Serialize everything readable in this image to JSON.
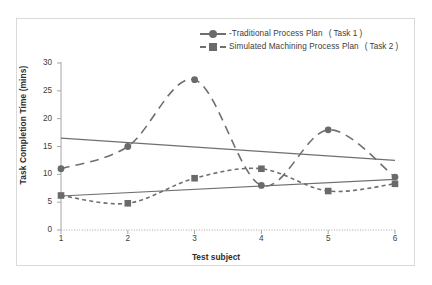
{
  "chart_data": {
    "type": "line",
    "title": "",
    "xlabel": "Test subject",
    "ylabel": "Task Completion Time (mins)",
    "x": [
      1,
      2,
      3,
      4,
      5,
      6
    ],
    "xtick_labels": [
      "1",
      "2",
      "3",
      "4",
      "5",
      "6"
    ],
    "ytick_labels": [
      "0",
      "5",
      "10",
      "15",
      "20",
      "25",
      "30"
    ],
    "yticks": [
      0,
      5,
      10,
      15,
      20,
      25,
      30
    ],
    "xlim": [
      1,
      6
    ],
    "ylim": [
      0,
      30
    ],
    "grid": false,
    "legend_position": "top-right",
    "series": [
      {
        "name": "Traditional Process Plan",
        "task": "( Task 1 )",
        "legend_label": "Traditional Process Plan",
        "legend_marker": "circle",
        "legend_dash": "solid-long-dash",
        "values": [
          11,
          15,
          27,
          8,
          18,
          9.5
        ],
        "color": "#6f6f6f"
      },
      {
        "name": "Simulated Machining Process Plan",
        "task": "( Task 2 )",
        "legend_label": "Simulated Machining Process Plan",
        "legend_marker": "square",
        "legend_dash": "dashed",
        "values": [
          6.2,
          4.8,
          9.3,
          11,
          7,
          8.3
        ],
        "color": "#6f6f6f"
      }
    ],
    "trendlines": [
      {
        "name": "Traditional Process Plan trendline",
        "for_series": "Traditional Process Plan",
        "start": [
          1,
          16.5
        ],
        "end": [
          6,
          12.5
        ],
        "style": "solid",
        "color": "#6f6f6f"
      },
      {
        "name": "Simulated Machining Process Plan trendline",
        "for_series": "Simulated Machining Process Plan",
        "start": [
          1,
          6.1
        ],
        "end": [
          6,
          9.1
        ],
        "style": "solid",
        "color": "#6f6f6f"
      }
    ],
    "legend": [
      {
        "label": "Traditional Process Plan",
        "task": "( Task 1 )",
        "marker": "circle",
        "line": "solid"
      },
      {
        "label": "Simulated Machining Process Plan",
        "task": "( Task 2 )",
        "marker": "square",
        "line": "dashed"
      }
    ],
    "colors": {
      "series_line": "#6f6f6f",
      "marker": "#6a6a6a",
      "axis": "#a6a6a6",
      "frame": "#d9d9d9",
      "text": "#3d3d3d",
      "background": "#ffffff"
    }
  },
  "legend": {
    "prefix_symbol": "-",
    "items": [
      {
        "label": "Traditional Process Plan",
        "task": "( Task 1 )"
      },
      {
        "label": "Simulated Machining Process Plan",
        "task": "( Task 2 )"
      }
    ]
  },
  "axes": {
    "xlabel": "Test subject",
    "ylabel": "Task Completion Time (mins)",
    "ytick_labels": [
      "30",
      "25",
      "20",
      "15",
      "10",
      "5",
      "0"
    ],
    "xtick_labels": [
      "1",
      "2",
      "3",
      "4",
      "5",
      "6"
    ]
  }
}
